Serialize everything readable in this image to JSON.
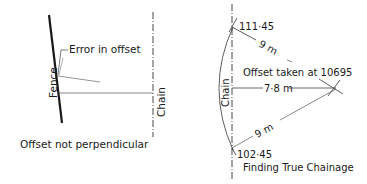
{
  "left_figure": {
    "caption": "Offset not perpendicular",
    "fence_label": "Fence",
    "chain_label": "Chain",
    "error_label": "Error in offset"
  },
  "right_figure": {
    "caption": "Finding True Chainage",
    "chain_label": "Chain",
    "upper_chainage": "111·45",
    "lower_chainage": "102·45",
    "upper_tie_length": "9 m",
    "lower_tie_length": "9 m",
    "offset_length": "7·8 m",
    "offset_note": "Offset taken at 10695"
  },
  "colors": {
    "ink": "#1a1a1a",
    "background": "#ffffff"
  }
}
